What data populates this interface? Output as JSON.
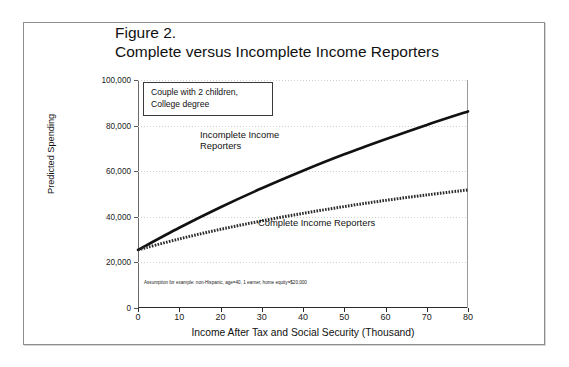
{
  "figure": {
    "title_line1": "Figure 2.",
    "title_line2": "Complete versus Incomplete Income Reporters"
  },
  "annotations": {
    "assumption_box_line1": "Couple with 2 children,",
    "assumption_box_line2": "College degree",
    "footnote": "Assumption for example: non-Hispanic, age=40, 1 earner, home equity=$20,000"
  },
  "chart_data": {
    "type": "line",
    "title": "Complete versus Incomplete Income Reporters",
    "xlabel": "Income After Tax and Social Security (Thousand)",
    "ylabel": "Predicted Spending",
    "xlim": [
      0,
      80
    ],
    "ylim": [
      0,
      100000
    ],
    "xticks": [
      0,
      10,
      20,
      30,
      40,
      50,
      60,
      70,
      80
    ],
    "xtick_labels": [
      "0",
      "10",
      "20",
      "30",
      "40",
      "50",
      "60",
      "70",
      "80"
    ],
    "yticks": [
      0,
      20000,
      40000,
      60000,
      80000,
      100000
    ],
    "ytick_labels": [
      "0",
      "20,000",
      "40,000",
      "60,000",
      "80,000",
      "100,000"
    ],
    "grid": "horizontal-dotted",
    "legend": "inline-labels",
    "x": [
      0,
      10,
      20,
      30,
      40,
      50,
      60,
      70,
      80
    ],
    "series": [
      {
        "name": "Incomplete Income Reporters",
        "style": "solid-thick",
        "color": "#111111",
        "values": [
          25500,
          35200,
          44200,
          52500,
          60200,
          67400,
          74000,
          80300,
          86200
        ]
      },
      {
        "name": "Complete Income Reporters",
        "style": "dashed-hatched",
        "color": "#2b2b2b",
        "values": [
          25500,
          30300,
          34500,
          38200,
          41500,
          44500,
          47200,
          49600,
          51800
        ]
      }
    ]
  }
}
